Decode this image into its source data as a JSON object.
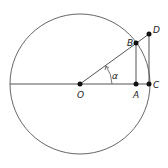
{
  "diagram": {
    "type": "unit circle trigonometry",
    "points": {
      "O": {
        "label": "O",
        "x": 80,
        "y": 84
      },
      "A": {
        "label": "A",
        "x": 136,
        "y": 84
      },
      "B": {
        "label": "B",
        "x": 136,
        "y": 43
      },
      "C": {
        "label": "C",
        "x": 149,
        "y": 84
      },
      "D": {
        "label": "D",
        "x": 149,
        "y": 34
      }
    },
    "angle_label": "α",
    "circle": {
      "cx": 80,
      "cy": 84,
      "r": 70
    },
    "stroke_color": "#555555"
  }
}
